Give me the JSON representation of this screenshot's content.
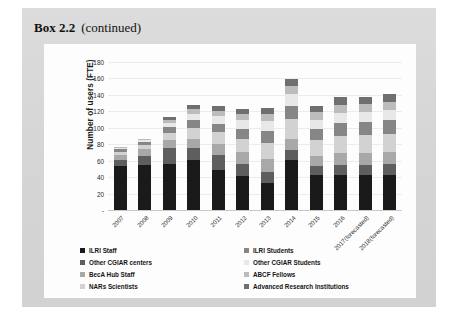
{
  "box": {
    "label": "Box 2.2",
    "continued": "(continued)"
  },
  "chart_data": {
    "type": "bar",
    "stacked": true,
    "title": "",
    "xlabel": "",
    "ylabel": "Number of users (FTE)",
    "ylim": [
      0,
      180
    ],
    "yticks": [
      "180",
      "160",
      "140",
      "120",
      "100",
      "80",
      "60",
      "40",
      "20",
      "-"
    ],
    "grid": true,
    "legend_position": "bottom",
    "categories": [
      "2007",
      "2008",
      "2009",
      "2010",
      "2011",
      "2012",
      "2013",
      "2014",
      "2015",
      "2016",
      "2017(forecasted)",
      "2018(forecasted)"
    ],
    "series": [
      {
        "name": "ILRI Staff",
        "color": "#1a1a1a",
        "values": [
          54,
          55,
          56,
          61,
          49,
          41,
          33,
          61,
          43,
          42,
          43,
          43
        ]
      },
      {
        "name": "Other CGIAR centers",
        "color": "#5e5e5e",
        "values": [
          7,
          11,
          19,
          14,
          18,
          15,
          13,
          12,
          10,
          13,
          12,
          13
        ]
      },
      {
        "name": "BecA Hub Staff",
        "color": "#a8a8a8",
        "values": [
          6,
          8,
          10,
          12,
          13,
          14,
          16,
          14,
          13,
          14,
          14,
          14
        ]
      },
      {
        "name": "NARs Scientists",
        "color": "#d2d2d2",
        "values": [
          4,
          5,
          9,
          13,
          15,
          16,
          20,
          24,
          19,
          21,
          22,
          22
        ]
      },
      {
        "name": "ILRI Students",
        "color": "#868686",
        "values": [
          3,
          4,
          7,
          9,
          10,
          12,
          14,
          16,
          14,
          16,
          16,
          17
        ]
      },
      {
        "name": "Other CGIAR Students",
        "color": "#e8e8e8",
        "values": [
          2,
          2,
          5,
          8,
          9,
          11,
          12,
          14,
          11,
          12,
          12,
          13
        ]
      },
      {
        "name": "ABCF Fellows",
        "color": "#bcbcbc",
        "values": [
          1,
          1,
          4,
          6,
          7,
          8,
          9,
          10,
          9,
          10,
          10,
          10
        ]
      },
      {
        "name": "Advanced Research Institutions",
        "color": "#6f6f6f",
        "values": [
          0,
          1,
          3,
          5,
          6,
          6,
          7,
          8,
          7,
          9,
          9,
          9
        ]
      }
    ],
    "totals": [
      77,
      87,
      113,
      128,
      127,
      123,
      124,
      159,
      126,
      137,
      138,
      141
    ]
  }
}
